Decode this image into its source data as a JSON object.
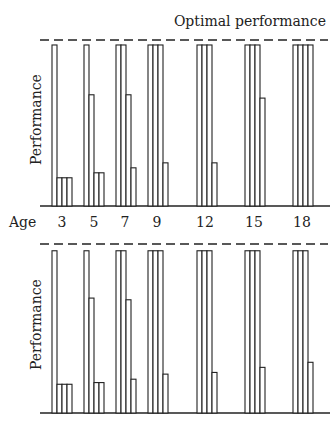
{
  "chart_data": [
    {
      "type": "bar",
      "title": "Optimal performance",
      "xlabel": "Age",
      "ylabel": "Performance",
      "categories": [
        "3",
        "5",
        "7",
        "9",
        "12",
        "15",
        "18"
      ],
      "reference_line": {
        "label": "Optimal performance",
        "value": 100,
        "style": "dashed"
      },
      "series": [
        {
          "name": "bar1",
          "values": [
            97,
            97,
            97,
            97,
            97,
            97,
            97
          ]
        },
        {
          "name": "bar2",
          "values": [
            17,
            67,
            97,
            97,
            97,
            97,
            97
          ]
        },
        {
          "name": "bar3",
          "values": [
            17,
            20,
            67,
            97,
            97,
            97,
            97
          ]
        },
        {
          "name": "bar4",
          "values": [
            17,
            20,
            23,
            26,
            26,
            65,
            97
          ]
        }
      ],
      "ylim": [
        0,
        100
      ],
      "grid": false
    },
    {
      "type": "bar",
      "xlabel": "Age",
      "ylabel": "Performance",
      "categories": [
        "3",
        "5",
        "7",
        "9",
        "12",
        "15",
        "18"
      ],
      "reference_line": {
        "label": "Optimal performance",
        "value": 100,
        "style": "dashed"
      },
      "series": [
        {
          "name": "bar1",
          "values": [
            96,
            96,
            96,
            96,
            96,
            96,
            96
          ]
        },
        {
          "name": "bar2",
          "values": [
            17,
            68,
            96,
            96,
            96,
            96,
            96
          ]
        },
        {
          "name": "bar3",
          "values": [
            17,
            18,
            67,
            96,
            96,
            96,
            96
          ]
        },
        {
          "name": "bar4",
          "values": [
            17,
            18,
            20,
            23,
            24,
            27,
            30
          ]
        }
      ],
      "ylim": [
        0,
        100
      ],
      "grid": false
    }
  ],
  "labels": {
    "title": "Optimal performance",
    "ylabel": "Performance",
    "xlabel": "Age",
    "ages": [
      "3",
      "5",
      "7",
      "9",
      "12",
      "15",
      "18"
    ]
  }
}
